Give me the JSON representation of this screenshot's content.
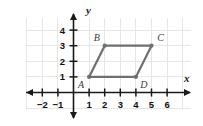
{
  "figure": {
    "background_color": "#ffffff",
    "grid_color": "#e4e4e4",
    "axis_color": "#1a1a1a",
    "shape_color": "#6b6b6b",
    "label_color": "#3a3a3a",
    "axis_label_x": "x",
    "axis_label_y": "y"
  },
  "chart_data": {
    "type": "scatter",
    "title": "",
    "xlabel": "x",
    "ylabel": "y",
    "xlim": [
      -3,
      7
    ],
    "ylim": [
      -2,
      5
    ],
    "grid": true,
    "legend": "none",
    "x_tick_labels": [
      "−2",
      "−1",
      "1",
      "2",
      "3",
      "4",
      "5",
      "6"
    ],
    "x_tick_values": [
      -2,
      -1,
      1,
      2,
      3,
      4,
      5,
      6
    ],
    "y_tick_labels": [
      "1",
      "2",
      "3",
      "4"
    ],
    "y_tick_values": [
      1,
      2,
      3,
      4
    ],
    "annotations": [
      {
        "label": "A",
        "x": 1,
        "y": 1,
        "placement": "below-left"
      },
      {
        "label": "B",
        "x": 2,
        "y": 3,
        "placement": "above-left"
      },
      {
        "label": "C",
        "x": 5,
        "y": 3,
        "placement": "above-right"
      },
      {
        "label": "D",
        "x": 4,
        "y": 1,
        "placement": "below-right"
      }
    ],
    "series": [
      {
        "name": "parallelogram ABCD",
        "closed": true,
        "points": [
          {
            "label": "A",
            "x": 1,
            "y": 1
          },
          {
            "label": "B",
            "x": 2,
            "y": 3
          },
          {
            "label": "C",
            "x": 5,
            "y": 3
          },
          {
            "label": "D",
            "x": 4,
            "y": 1
          }
        ]
      }
    ]
  },
  "ticks": {
    "x": [
      {
        "value": -2,
        "label": "−2"
      },
      {
        "value": -1,
        "label": "−1"
      },
      {
        "value": 1,
        "label": "1"
      },
      {
        "value": 2,
        "label": "2"
      },
      {
        "value": 3,
        "label": "3"
      },
      {
        "value": 4,
        "label": "4"
      },
      {
        "value": 5,
        "label": "5"
      },
      {
        "value": 6,
        "label": "6"
      }
    ],
    "y": [
      {
        "value": 1,
        "label": "1"
      },
      {
        "value": 2,
        "label": "2"
      },
      {
        "value": 3,
        "label": "3"
      },
      {
        "value": 4,
        "label": "4"
      }
    ]
  },
  "vertices": [
    {
      "label": "A",
      "x": 1,
      "y": 1
    },
    {
      "label": "B",
      "x": 2,
      "y": 3
    },
    {
      "label": "C",
      "x": 5,
      "y": 3
    },
    {
      "label": "D",
      "x": 4,
      "y": 1
    }
  ]
}
